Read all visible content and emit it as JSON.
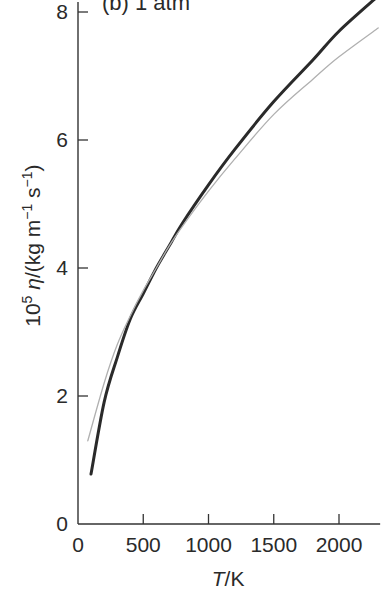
{
  "chart_data": {
    "type": "line",
    "title": "",
    "panel_label": "(b) 1 atm",
    "xlabel": "T/K",
    "xlabel_italic_part": "T",
    "xlabel_unit_part": "/K",
    "ylabel": "10^5 η/(kg m^-1 s^-1)",
    "xlim": [
      0,
      2300
    ],
    "ylim": [
      0,
      8
    ],
    "xticks": [
      0,
      500,
      1000,
      1500,
      2000
    ],
    "yticks": [
      0,
      2,
      4,
      6,
      8
    ],
    "xtick_labels": [
      "0",
      "500",
      "1000",
      "1500",
      "2000"
    ],
    "ytick_labels": [
      "0",
      "2",
      "4",
      "6",
      "8"
    ],
    "grid": false,
    "legend": null,
    "series": [
      {
        "name": "thick curve",
        "style": "thick dark",
        "color": "#2a2a2a",
        "x": [
          100,
          200,
          300,
          400,
          500,
          600,
          700,
          800,
          1000,
          1200,
          1500,
          1800,
          2000,
          2300
        ],
        "y": [
          0.78,
          1.9,
          2.6,
          3.2,
          3.6,
          4.0,
          4.35,
          4.7,
          5.3,
          5.85,
          6.6,
          7.25,
          7.7,
          8.25
        ]
      },
      {
        "name": "thin curve",
        "style": "thin light",
        "color": "#b0b0b0",
        "x": [
          75,
          200,
          300,
          400,
          500,
          600,
          700,
          800,
          1000,
          1200,
          1500,
          1800,
          2000,
          2300
        ],
        "y": [
          1.3,
          2.2,
          2.8,
          3.25,
          3.65,
          4.0,
          4.35,
          4.65,
          5.2,
          5.7,
          6.4,
          6.95,
          7.3,
          7.75
        ]
      }
    ]
  }
}
